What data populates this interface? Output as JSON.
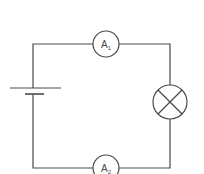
{
  "diagram": {
    "type": "circuit",
    "components": [
      {
        "id": "cell",
        "kind": "cell",
        "label": ""
      },
      {
        "id": "ammeter1",
        "kind": "ammeter",
        "label": "A",
        "subscript": "1"
      },
      {
        "id": "lamp",
        "kind": "lamp",
        "label": ""
      },
      {
        "id": "ammeter2",
        "kind": "ammeter",
        "label": "A",
        "subscript": "2"
      }
    ],
    "colors": {
      "line": "#4a4a4a",
      "background": "#ffffff"
    }
  }
}
